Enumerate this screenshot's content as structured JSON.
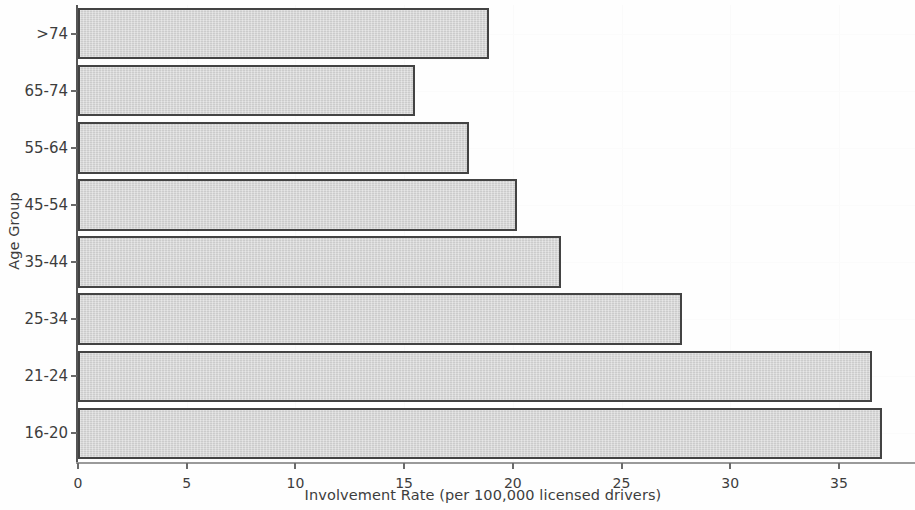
{
  "chart_data": {
    "type": "bar",
    "orientation": "horizontal",
    "title": "",
    "xlabel": "Involvement Rate (per 100,000 licensed drivers)",
    "ylabel": "Age Group",
    "categories": [
      ">74",
      "65-74",
      "55-64",
      "45-54",
      "35-44",
      "25-34",
      "21-24",
      "16-20"
    ],
    "values": [
      18.9,
      15.5,
      18.0,
      20.2,
      22.2,
      27.8,
      36.5,
      37.0
    ],
    "series": [
      {
        "name": "Involvement Rate",
        "values": [
          18.9,
          15.5,
          18.0,
          20.2,
          22.2,
          27.8,
          36.5,
          37.0
        ]
      }
    ],
    "xlim": [
      0,
      38.5
    ],
    "xticks": [
      0,
      5,
      10,
      15,
      20,
      25,
      30,
      35
    ],
    "xtick_labels": [
      "0",
      "5",
      "10",
      "15",
      "20",
      "25",
      "30",
      "35"
    ],
    "ytick_labels": [
      ">74",
      "65-74",
      "55-64",
      "45-54",
      "35-44",
      "25-34",
      "21-24",
      "16-20"
    ],
    "grid": true,
    "grid_color": "#fafafa",
    "legend": null,
    "bar_fill_color": "#d2d2d2",
    "bar_edge_color": "#434343",
    "axis_color": "#6a6a6a",
    "text_color": "#3d3d3d",
    "background_color": "#fefefe"
  },
  "artifacts": {
    "faint_marks": [
      "",
      ""
    ]
  }
}
